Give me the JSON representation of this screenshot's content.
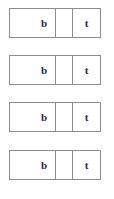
{
  "page": {
    "background_color": "#ffffff",
    "border_color": "#8c8c8c",
    "text_color": "#2b2b2b"
  },
  "diagram": {
    "type": "stacked-three-cell-tables",
    "row_count": 4,
    "rows": [
      {
        "index": 1,
        "top": 8,
        "cells": [
          {
            "name": "left",
            "label": "b"
          },
          {
            "name": "middle",
            "label": ""
          },
          {
            "name": "right",
            "label": "t"
          }
        ]
      },
      {
        "index": 2,
        "top": 55,
        "cells": [
          {
            "name": "left",
            "label": "b"
          },
          {
            "name": "middle",
            "label": ""
          },
          {
            "name": "right",
            "label": "t"
          }
        ]
      },
      {
        "index": 3,
        "top": 102,
        "cells": [
          {
            "name": "left",
            "label": "b"
          },
          {
            "name": "middle",
            "label": ""
          },
          {
            "name": "right",
            "label": "t"
          }
        ]
      },
      {
        "index": 4,
        "top": 150,
        "cells": [
          {
            "name": "left",
            "label": "b"
          },
          {
            "name": "middle",
            "label": ""
          },
          {
            "name": "right",
            "label": "t"
          }
        ]
      }
    ]
  }
}
